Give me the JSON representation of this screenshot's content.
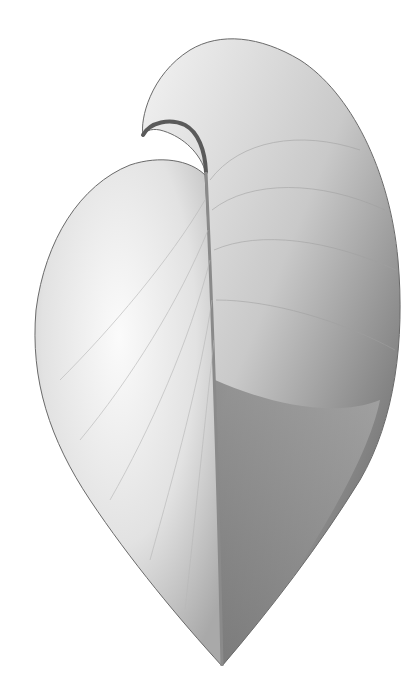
{
  "image": {
    "subject": "Scientific engraving of a bivalve shell (heart-shaped, umbo curled)",
    "background_color": "#ffffff",
    "shell_light": "#f2f2f2",
    "shell_mid": "#c8c8c8",
    "shell_dark": "#6e6e6e",
    "outline_color": "#555555"
  }
}
